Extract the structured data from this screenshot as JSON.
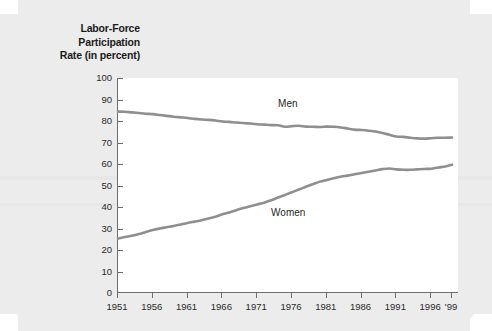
{
  "figure": {
    "title_lines": [
      "Labor-Force",
      "Participation",
      "Rate (in percent)"
    ],
    "title_full": "Labor-Force Participation Rate (in percent)",
    "background_color": "#ececec",
    "plot_background_color": "#ffffff",
    "axis_color": "#6e6e6e",
    "line_color": "#8f8f8f"
  },
  "chart_data": {
    "type": "line",
    "title": "Labor-Force Participation Rate (in percent)",
    "xlabel": "",
    "ylabel": "Labor-Force Participation Rate (in percent)",
    "xlim": [
      1951,
      2000
    ],
    "ylim": [
      0,
      100
    ],
    "yticks": [
      0,
      10,
      20,
      30,
      40,
      50,
      60,
      70,
      80,
      90,
      100
    ],
    "ytick_labels": [
      "0",
      "10",
      "20",
      "30",
      "40",
      "50",
      "60",
      "70",
      "80",
      "90",
      "100"
    ],
    "xticks": [
      1951,
      1956,
      1961,
      1966,
      1971,
      1976,
      1981,
      1986,
      1991,
      1996,
      1999
    ],
    "xtick_labels": [
      "1951",
      "1956",
      "1961",
      "1966",
      "1971",
      "1976",
      "1981",
      "1986",
      "1991",
      "1996",
      "'99"
    ],
    "grid": false,
    "legend": "inline-labels",
    "annotations": [
      {
        "text": "Men",
        "x": 1974,
        "y": 88
      },
      {
        "text": "Women",
        "x": 1973,
        "y": 37
      }
    ],
    "x": [
      1951,
      1952,
      1953,
      1954,
      1955,
      1956,
      1957,
      1958,
      1959,
      1960,
      1961,
      1962,
      1963,
      1964,
      1965,
      1966,
      1967,
      1968,
      1969,
      1970,
      1971,
      1972,
      1973,
      1974,
      1975,
      1976,
      1977,
      1978,
      1979,
      1980,
      1981,
      1982,
      1983,
      1984,
      1985,
      1986,
      1987,
      1988,
      1989,
      1990,
      1991,
      1992,
      1993,
      1994,
      1995,
      1996,
      1997,
      1998,
      1999
    ],
    "series": [
      {
        "name": "Men",
        "color": "#8f8f8f",
        "values": [
          84.4,
          84.3,
          84.0,
          83.7,
          83.4,
          83.2,
          82.8,
          82.4,
          82.0,
          81.7,
          81.4,
          81.0,
          80.7,
          80.5,
          80.2,
          79.8,
          79.6,
          79.3,
          79.1,
          78.8,
          78.5,
          78.3,
          78.1,
          78.0,
          77.3,
          77.6,
          77.8,
          77.4,
          77.3,
          77.2,
          77.4,
          77.3,
          77.0,
          76.5,
          76.0,
          75.8,
          75.5,
          75.1,
          74.4,
          73.6,
          72.8,
          72.6,
          72.2,
          71.9,
          71.8,
          72.0,
          72.2,
          72.2,
          72.3
        ]
      },
      {
        "name": "Women",
        "color": "#8f8f8f",
        "values": [
          25.3,
          26.0,
          26.6,
          27.4,
          28.4,
          29.3,
          30.0,
          30.6,
          31.2,
          31.9,
          32.6,
          33.2,
          33.8,
          34.6,
          35.5,
          36.6,
          37.5,
          38.5,
          39.5,
          40.4,
          41.2,
          42.0,
          43.1,
          44.4,
          45.6,
          46.9,
          48.1,
          49.4,
          50.6,
          51.8,
          52.6,
          53.4,
          54.1,
          54.6,
          55.2,
          55.8,
          56.4,
          57.0,
          57.6,
          57.9,
          57.5,
          57.3,
          57.3,
          57.5,
          57.7,
          57.8,
          58.4,
          58.8,
          59.7
        ]
      }
    ]
  }
}
